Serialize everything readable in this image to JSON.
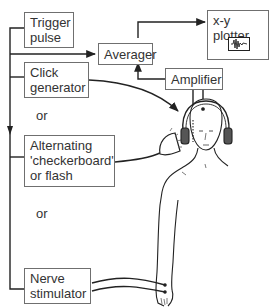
{
  "diagram": {
    "boxes": {
      "trigger": {
        "label_line1": "Trigger",
        "label_line2": "pulse"
      },
      "averager": {
        "label": "Averager"
      },
      "plotter": {
        "label": "x-y plotter",
        "icon": "waveform-icon"
      },
      "amplifier": {
        "label": "Amplifier"
      },
      "click": {
        "label_line1": "Click",
        "label_line2": "generator"
      },
      "alternating": {
        "label_line1": "Alternating",
        "label_line2": "'checkerboard'",
        "label_line3": "or flash"
      },
      "nerve": {
        "label_line1": "Nerve",
        "label_line2": "stimulator"
      }
    },
    "connectors": {
      "or_1": "or",
      "or_2": "or"
    },
    "figures": {
      "subject": "person-with-headphones-illustration",
      "flash_lamp": "flash-lamp-icon",
      "arm": "arm-with-electrodes-illustration"
    },
    "colors": {
      "line": "#222222",
      "box_border": "#6f6f6f",
      "text": "#333333",
      "background": "#ffffff"
    }
  }
}
